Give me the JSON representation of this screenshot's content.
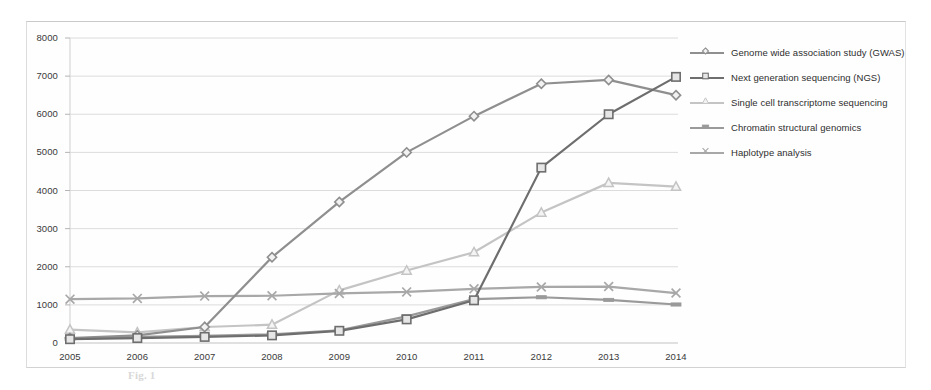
{
  "chart_data": {
    "type": "line",
    "title": "",
    "xlabel": "",
    "ylabel": "",
    "categories": [
      "2005",
      "2006",
      "2007",
      "2008",
      "2009",
      "2010",
      "2011",
      "2012",
      "2013",
      "2014"
    ],
    "x": [
      2005,
      2006,
      2007,
      2008,
      2009,
      2010,
      2011,
      2012,
      2013,
      2014
    ],
    "ylim": [
      0,
      8000
    ],
    "xlim": [
      2005,
      2014
    ],
    "yticks": [
      0,
      1000,
      2000,
      3000,
      4000,
      5000,
      6000,
      7000,
      8000
    ],
    "ytick_labels": [
      "0",
      "1000",
      "2000",
      "3000",
      "4000",
      "5000",
      "6000",
      "7000",
      "8000"
    ],
    "grid": true,
    "grid_axis": "y",
    "legend_position": "right",
    "series": [
      {
        "name": "Genome wide association study (GWAS)",
        "color": "#8f8f8f",
        "marker": "diamond",
        "values": [
          130,
          200,
          420,
          2250,
          3700,
          5000,
          5950,
          6800,
          6900,
          6500
        ]
      },
      {
        "name": "Next generation sequencing (NGS)",
        "color": "#6e6e6e",
        "marker": "square",
        "values": [
          100,
          130,
          160,
          200,
          320,
          620,
          1120,
          4600,
          6000,
          6980
        ]
      },
      {
        "name": "Single cell transcriptome sequencing",
        "color": "#c4c4c4",
        "marker": "triangle",
        "values": [
          350,
          280,
          420,
          480,
          1380,
          1900,
          2380,
          3420,
          4200,
          4100
        ]
      },
      {
        "name": "Chromatin structural genomics",
        "color": "#9a9a9a",
        "marker": "dash",
        "values": [
          110,
          160,
          190,
          230,
          330,
          700,
          1150,
          1200,
          1130,
          1010
        ]
      },
      {
        "name": "Haplotype analysis",
        "color": "#a8a8a8",
        "marker": "cross",
        "values": [
          1150,
          1170,
          1230,
          1240,
          1300,
          1340,
          1420,
          1470,
          1480,
          1310
        ]
      }
    ]
  },
  "legend": {
    "items": [
      {
        "label": "Genome wide association study (GWAS)"
      },
      {
        "label": "Next generation sequencing (NGS)"
      },
      {
        "label": "Single cell transcriptome sequencing"
      },
      {
        "label": "Chromatin structural genomics"
      },
      {
        "label": "Haplotype analysis"
      }
    ]
  },
  "caption": {
    "text": "Fig. 1"
  }
}
